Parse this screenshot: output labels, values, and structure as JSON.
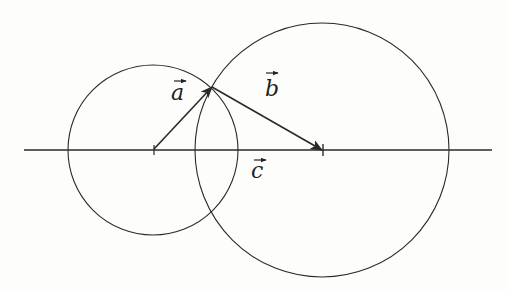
{
  "diagram": {
    "title": "",
    "labels": {
      "a": "a",
      "b": "b",
      "c": "c"
    },
    "colors": {
      "stroke": "#2a2a2a",
      "background": "#fdfdfb"
    },
    "geometry": {
      "axis": {
        "x1": 24,
        "x2": 492,
        "y": 150
      },
      "left_circle": {
        "cx": 153,
        "cy": 150,
        "r": 85
      },
      "right_circle": {
        "cx": 322,
        "cy": 150,
        "r": 127
      },
      "vector_a": {
        "x1": 153,
        "y1": 150,
        "x2": 212,
        "y2": 87
      },
      "vector_b": {
        "x1": 212,
        "y1": 87,
        "x2": 322,
        "y2": 150
      },
      "vector_c": {
        "x1": 153,
        "y1": 150,
        "x2": 322,
        "y2": 150
      }
    }
  }
}
